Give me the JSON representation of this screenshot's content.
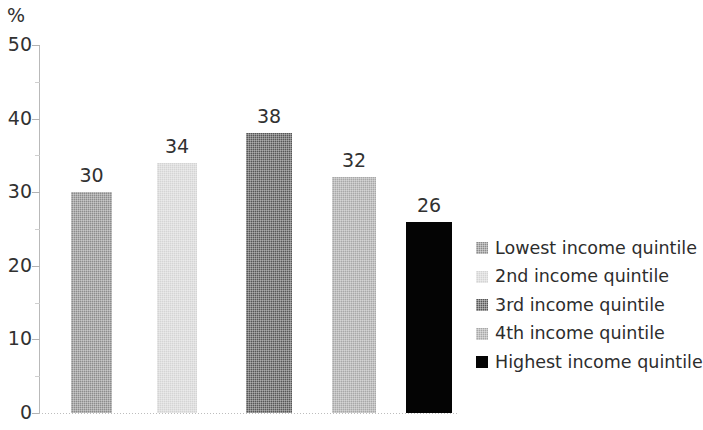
{
  "chart_data": {
    "type": "bar",
    "title": "",
    "subtitle": "",
    "xlabel": "",
    "ylabel": "%",
    "unit_label": "%",
    "ylim": [
      0,
      50
    ],
    "ytick_labels": [
      "0",
      "10",
      "20",
      "30",
      "40",
      "50"
    ],
    "ytick_values": [
      0,
      10,
      20,
      30,
      40,
      50
    ],
    "minor_ticks": true,
    "grid": false,
    "legend_position": "right",
    "categories": [
      "Lowest income quintile",
      "2nd income quintile",
      "3rd income quintile",
      "4th income quintile",
      "Highest income quintile"
    ],
    "values": [
      30,
      34,
      38,
      32,
      26
    ],
    "value_labels": [
      "30",
      "34",
      "38",
      "32",
      "26"
    ],
    "bar_colors": [
      "#8c8c8c",
      "#d4d4d4",
      "#575757",
      "#a8a8a8",
      "#040404"
    ],
    "bars": [
      {
        "label": "Lowest income quintile",
        "value": 30,
        "value_label": "30",
        "color": "#8c8c8c",
        "pattern": "dither"
      },
      {
        "label": "2nd income quintile",
        "value": 34,
        "value_label": "34",
        "color": "#d4d4d4",
        "pattern": "dither"
      },
      {
        "label": "3rd income quintile",
        "value": 38,
        "value_label": "38",
        "color": "#575757",
        "pattern": "dither"
      },
      {
        "label": "4th income quintile",
        "value": 32,
        "value_label": "32",
        "color": "#a8a8a8",
        "pattern": "dither"
      },
      {
        "label": "Highest income quintile",
        "value": 26,
        "value_label": "26",
        "color": "#040404",
        "pattern": "solid"
      }
    ]
  },
  "legend": {
    "items": [
      {
        "label": "Lowest income quintile",
        "color": "#8c8c8c",
        "pattern": "dither"
      },
      {
        "label": "2nd income quintile",
        "color": "#d4d4d4",
        "pattern": "dither"
      },
      {
        "label": "3rd income quintile",
        "color": "#575757",
        "pattern": "dither"
      },
      {
        "label": "4th income quintile",
        "color": "#a8a8a8",
        "pattern": "dither"
      },
      {
        "label": "Highest income quintile",
        "color": "#040404",
        "pattern": "solid"
      }
    ]
  },
  "axis": {
    "unit": "%",
    "labels": [
      "50",
      "40",
      "30",
      "20",
      "10",
      "0"
    ]
  }
}
